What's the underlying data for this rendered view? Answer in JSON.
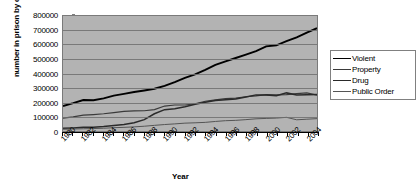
{
  "chart_data": {
    "type": "line",
    "title": "",
    "xlabel": "Year",
    "ylabel": "number in prison by crime type",
    "xlim": [
      1980,
      2005
    ],
    "ylim": [
      0,
      800000
    ],
    "grid": true,
    "legend_position": "right",
    "y_ticks": [
      800000,
      700000,
      600000,
      500000,
      400000,
      300000,
      200000,
      100000,
      0
    ],
    "x_tick_labels": [
      "1980",
      "1982",
      "1984",
      "1986",
      "1988",
      "1990",
      "1992",
      "1994",
      "1996",
      "1998",
      "2000",
      "2002",
      "2004"
    ],
    "x": [
      1980,
      1981,
      1982,
      1983,
      1984,
      1985,
      1986,
      1987,
      1988,
      1989,
      1990,
      1991,
      1992,
      1993,
      1994,
      1995,
      1996,
      1997,
      1998,
      1999,
      2000,
      2001,
      2002,
      2003,
      2004,
      2005
    ],
    "series": [
      {
        "name": "Violent",
        "color": "#000000",
        "values": [
          173300,
          193300,
          215300,
          214400,
          227300,
          246200,
          258600,
          271300,
          282000,
          293900,
          313600,
          339500,
          369100,
          393900,
          425700,
          459600,
          484800,
          507800,
          531100,
          556000,
          589100,
          596100,
          624900,
          652000,
          684700,
          715000
        ]
      },
      {
        "name": "Property",
        "color": "#3a3a3a",
        "values": [
          89300,
          97800,
          110000,
          114400,
          120000,
          128000,
          136900,
          140100,
          140700,
          148600,
          173700,
          180700,
          181000,
          189600,
          207000,
          216300,
          224600,
          229200,
          238200,
          245000,
          253500,
          251500,
          253000,
          260000,
          265000,
          249000
        ]
      },
      {
        "name": "Drug",
        "color": "#2a2a2a",
        "values": [
          19000,
          21700,
          25300,
          26600,
          31700,
          38900,
          45400,
          57900,
          79100,
          120100,
          148600,
          155200,
          168100,
          186400,
          200200,
          212800,
          216900,
          222100,
          236800,
          251200,
          251100,
          246100,
          265100,
          250000,
          253000,
          253300
        ]
      },
      {
        "name": "Public Order",
        "color": "#555555",
        "values": [
          12400,
          14000,
          15600,
          17000,
          19200,
          23000,
          25400,
          28800,
          33200,
          39300,
          45000,
          49500,
          54600,
          57000,
          60000,
          66400,
          71700,
          74100,
          79100,
          84700,
          87500,
          90000,
          95000,
          78000,
          82000,
          86000
        ]
      }
    ]
  },
  "legend": {
    "items": [
      {
        "label": "Violent"
      },
      {
        "label": "Property"
      },
      {
        "label": "Drug"
      },
      {
        "label": "Public Order"
      }
    ]
  }
}
